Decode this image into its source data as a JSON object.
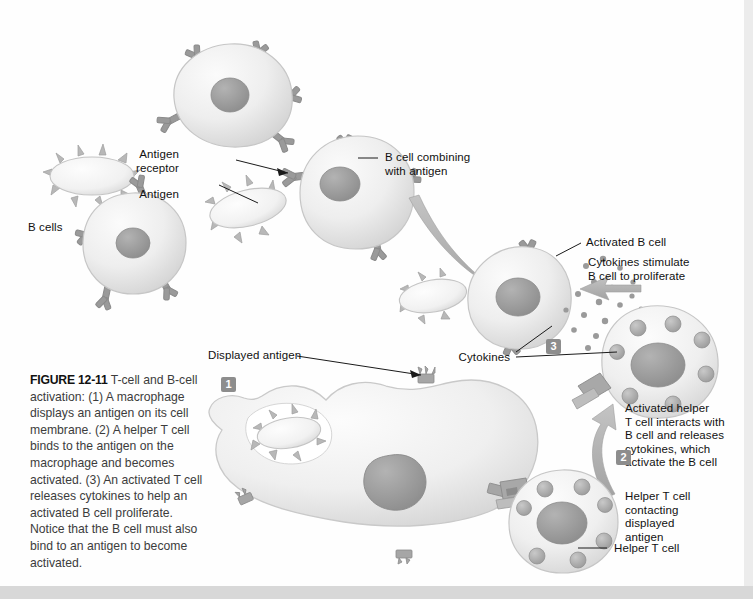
{
  "figure": {
    "number": "FIGURE 12-11",
    "caption_text": " T-cell and B-cell activation: (1) A macrophage displays an antigen on its cell membrane. (2) A helper T cell binds to the antigen on the macrophage and becomes activated. (3) An activated T cell releases cytokines to help an activated B cell proliferate. Notice that the B cell must also bind to an antigen to become activated."
  },
  "steps": {
    "one": "1",
    "two": "2",
    "three": "3"
  },
  "labels": {
    "b_cells": "B cells",
    "antigen_receptor": "Antigen\nreceptor",
    "antigen": "Antigen",
    "b_cell_combining": "B cell combining\nwith antigen",
    "activated_b_cell": "Activated B cell",
    "cytokines_stimulate": "Cytokines stimulate\nB cell to proliferate",
    "cytokines": "Cytokines",
    "activated_helper": "Activated helper\nT cell interacts with\nB cell and releases\ncytokines, which\nactivate the B cell",
    "helper_t_contacting": "Helper T cell\ncontacting\ndisplayed\nantigen",
    "helper_t_cell": "Helper T cell",
    "displayed_antigen": "Displayed antigen"
  },
  "colors": {
    "cell_fill": "#eeeeee",
    "cell_edge": "#c9c9c9",
    "nucleus": "#9c9c9c",
    "receptor": "#9a9a9a",
    "receptor_dark": "#7e7e7e",
    "arrow": "#b0b0b0",
    "granule": "#b4b4b4",
    "text": "#111111",
    "step_badge": "#8d8d8d"
  }
}
